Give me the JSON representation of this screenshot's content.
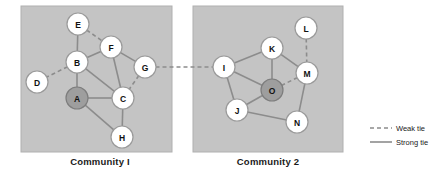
{
  "figure": {
    "width": 444,
    "height": 181,
    "background": "#ffffff"
  },
  "style": {
    "panel_fill": "#c4c4c4",
    "panel_stroke": "#b0b0b0",
    "node_fill": "#ffffff",
    "node_stroke": "#9a9a9a",
    "hub_node_fill": "#9e9e9e",
    "hub_node_stroke": "#7d7d7d",
    "edge_color": "#8c8c8c",
    "node_radius": 11,
    "edge_width": 1.6,
    "label_color": "#1a1a1a"
  },
  "panels": [
    {
      "id": "community-1",
      "label": "Community I",
      "label_x": 100,
      "label_y": 165,
      "rect": {
        "x": 21,
        "y": 6,
        "width": 151,
        "height": 146
      }
    },
    {
      "id": "community-2",
      "label": "Community 2",
      "label_x": 268,
      "label_y": 165,
      "rect": {
        "x": 193,
        "y": 6,
        "width": 150,
        "height": 146
      }
    }
  ],
  "nodes": [
    {
      "id": "A",
      "label": "A",
      "x": 77,
      "y": 98,
      "community": "community-1",
      "hub": true
    },
    {
      "id": "B",
      "label": "B",
      "x": 77,
      "y": 62,
      "community": "community-1",
      "hub": false
    },
    {
      "id": "C",
      "label": "C",
      "x": 123,
      "y": 98,
      "community": "community-1",
      "hub": false
    },
    {
      "id": "D",
      "label": "D",
      "x": 37,
      "y": 82,
      "community": "community-1",
      "hub": false
    },
    {
      "id": "E",
      "label": "E",
      "x": 78,
      "y": 24,
      "community": "community-1",
      "hub": false
    },
    {
      "id": "F",
      "label": "F",
      "x": 111,
      "y": 47,
      "community": "community-1",
      "hub": false
    },
    {
      "id": "G",
      "label": "G",
      "x": 145,
      "y": 67,
      "community": "community-1",
      "hub": false
    },
    {
      "id": "H",
      "label": "H",
      "x": 122,
      "y": 137,
      "community": "community-1",
      "hub": false
    },
    {
      "id": "I",
      "label": "I",
      "x": 224,
      "y": 67,
      "community": "community-2",
      "hub": false
    },
    {
      "id": "J",
      "label": "J",
      "x": 237,
      "y": 110,
      "community": "community-2",
      "hub": false
    },
    {
      "id": "K",
      "label": "K",
      "x": 272,
      "y": 48,
      "community": "community-2",
      "hub": false
    },
    {
      "id": "L",
      "label": "L",
      "x": 306,
      "y": 28,
      "community": "community-2",
      "hub": false
    },
    {
      "id": "M",
      "label": "M",
      "x": 307,
      "y": 73,
      "community": "community-2",
      "hub": false
    },
    {
      "id": "N",
      "label": "N",
      "x": 297,
      "y": 122,
      "community": "community-2",
      "hub": false
    },
    {
      "id": "O",
      "label": "O",
      "x": 272,
      "y": 90,
      "community": "community-2",
      "hub": true
    }
  ],
  "edges": [
    {
      "source": "E",
      "target": "B",
      "tie": "strong"
    },
    {
      "source": "E",
      "target": "F",
      "tie": "weak"
    },
    {
      "source": "B",
      "target": "D",
      "tie": "weak"
    },
    {
      "source": "B",
      "target": "F",
      "tie": "strong"
    },
    {
      "source": "B",
      "target": "A",
      "tie": "strong"
    },
    {
      "source": "B",
      "target": "C",
      "tie": "strong"
    },
    {
      "source": "F",
      "target": "G",
      "tie": "strong"
    },
    {
      "source": "F",
      "target": "C",
      "tie": "strong"
    },
    {
      "source": "G",
      "target": "C",
      "tie": "weak"
    },
    {
      "source": "A",
      "target": "C",
      "tie": "strong"
    },
    {
      "source": "A",
      "target": "H",
      "tie": "strong"
    },
    {
      "source": "C",
      "target": "H",
      "tie": "strong"
    },
    {
      "source": "G",
      "target": "I",
      "tie": "weak"
    },
    {
      "source": "I",
      "target": "K",
      "tie": "strong"
    },
    {
      "source": "I",
      "target": "O",
      "tie": "strong"
    },
    {
      "source": "I",
      "target": "J",
      "tie": "strong"
    },
    {
      "source": "K",
      "target": "O",
      "tie": "strong"
    },
    {
      "source": "K",
      "target": "M",
      "tie": "strong"
    },
    {
      "source": "L",
      "target": "M",
      "tie": "weak"
    },
    {
      "source": "M",
      "target": "O",
      "tie": "weak"
    },
    {
      "source": "M",
      "target": "N",
      "tie": "strong"
    },
    {
      "source": "J",
      "target": "O",
      "tie": "strong"
    },
    {
      "source": "J",
      "target": "N",
      "tie": "strong"
    }
  ],
  "legend": {
    "box": {
      "x": 366,
      "y": 120,
      "width": 76,
      "height": 30
    },
    "items": [
      {
        "id": "weak-tie",
        "label": "Weak tie",
        "tie": "weak",
        "line_x1": 370,
        "line_x2": 392,
        "y": 128,
        "text_x": 396
      },
      {
        "id": "strong-tie",
        "label": "Strong tie",
        "tie": "strong",
        "line_x1": 370,
        "line_x2": 392,
        "y": 142,
        "text_x": 396
      }
    ]
  }
}
